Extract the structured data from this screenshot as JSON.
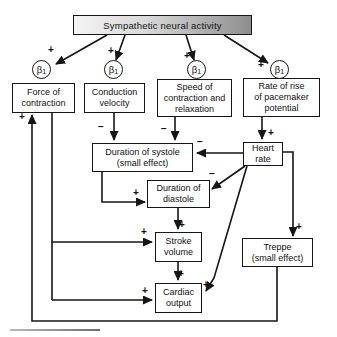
{
  "figure": {
    "receptor": {
      "symbol": "β",
      "subscript": "1"
    },
    "nodes": {
      "sympathetic": "Sympathetic neural activity",
      "force": "Force of\ncontraction",
      "conduction": "Conduction\nvelocity",
      "speed": "Speed of\ncontraction and\nrelaxation",
      "rate": "Rate of rise\nof pacemaker\npotential",
      "systole": "Duration of systole\n(small effect)",
      "heart": "Heart\nrate",
      "diastole": "Duration of\ndiastole",
      "stroke": "Stroke\nvolume",
      "treppe": "Treppe\n(small effect)",
      "cardiac": "Cardiac\noutput"
    },
    "edges": [
      {
        "from": "sympathetic-neural-activity",
        "to": "beta1-receptor-force",
        "sign": "+"
      },
      {
        "from": "sympathetic-neural-activity",
        "to": "beta1-receptor-conduction",
        "sign": "+"
      },
      {
        "from": "sympathetic-neural-activity",
        "to": "beta1-receptor-speed",
        "sign": "+"
      },
      {
        "from": "sympathetic-neural-activity",
        "to": "beta1-receptor-rate",
        "sign": "+"
      },
      {
        "from": "treppe",
        "to": "force-of-contraction",
        "sign": "+"
      },
      {
        "from": "conduction-velocity",
        "to": "duration-of-systole",
        "sign": "−"
      },
      {
        "from": "speed-of-contraction-and-relaxation",
        "to": "duration-of-systole",
        "sign": "−"
      },
      {
        "from": "rate-of-rise-of-pacemaker-potential",
        "to": "heart-rate",
        "sign": "+"
      },
      {
        "from": "heart-rate",
        "to": "duration-of-systole",
        "sign": "−"
      },
      {
        "from": "heart-rate",
        "to": "duration-of-diastole",
        "sign": "−"
      },
      {
        "from": "duration-of-systole",
        "to": "duration-of-diastole",
        "sign": "+"
      },
      {
        "from": "duration-of-diastole",
        "to": "stroke-volume",
        "sign": "+"
      },
      {
        "from": "force-of-contraction",
        "to": "stroke-volume",
        "sign": "+"
      },
      {
        "from": "stroke-volume",
        "to": "cardiac-output",
        "sign": "+"
      },
      {
        "from": "force-of-contraction",
        "to": "cardiac-output",
        "sign": "+"
      },
      {
        "from": "heart-rate",
        "to": "cardiac-output",
        "sign": "+"
      },
      {
        "from": "heart-rate",
        "to": "treppe",
        "sign": "+"
      }
    ],
    "colors": {
      "line": "#151515",
      "box_fill": "#ffffff",
      "title_gradient_start": "#f4f4f4",
      "title_gradient_end": "#8e8e8e"
    }
  }
}
